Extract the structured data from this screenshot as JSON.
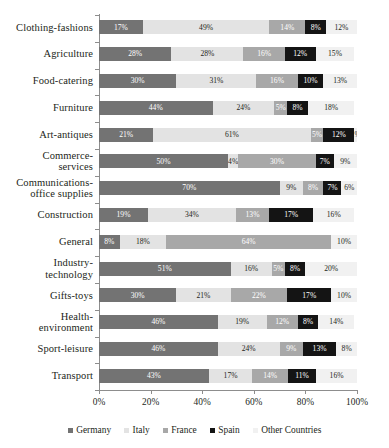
{
  "chart_data": {
    "type": "bar",
    "subtype": "stacked-horizontal-100pct",
    "title": "",
    "xlabel": "",
    "ylabel": "",
    "xlim": [
      0,
      100
    ],
    "xticks": [
      "0%",
      "20%",
      "40%",
      "60%",
      "80%",
      "100%"
    ],
    "xtick_values": [
      0,
      20,
      40,
      60,
      80,
      100
    ],
    "grid": false,
    "legend_position": "bottom",
    "value_suffix": "%",
    "categories": [
      "Clothing-fashions",
      "Agriculture",
      "Food-catering",
      "Furniture",
      "Art-antiques",
      "Commerce-services",
      "Communications-office supplies",
      "Construction",
      "General",
      "Industry-technology",
      "Gifts-toys",
      "Health-environment",
      "Sport-leisure",
      "Transport"
    ],
    "category_lines": [
      [
        "Clothing-fashions"
      ],
      [
        "Agriculture"
      ],
      [
        "Food-catering"
      ],
      [
        "Furniture"
      ],
      [
        "Art-antiques"
      ],
      [
        "Commerce-",
        "services"
      ],
      [
        "Communications-",
        "office supplies"
      ],
      [
        "Construction"
      ],
      [
        "General"
      ],
      [
        "Industry-",
        "technology"
      ],
      [
        "Gifts-toys"
      ],
      [
        "Health-",
        "environment"
      ],
      [
        "Sport-leisure"
      ],
      [
        "Transport"
      ]
    ],
    "series": [
      {
        "name": "Germany",
        "color": "#737373",
        "values": [
          17,
          28,
          30,
          44,
          21,
          50,
          70,
          19,
          8,
          51,
          30,
          46,
          46,
          43
        ]
      },
      {
        "name": "Italy",
        "color": "#e3e3e3",
        "values": [
          49,
          28,
          31,
          24,
          61,
          4,
          9,
          34,
          18,
          16,
          21,
          19,
          24,
          17
        ]
      },
      {
        "name": "France",
        "color": "#a8a8a8",
        "values": [
          14,
          16,
          16,
          5,
          5,
          30,
          8,
          13,
          64,
          5,
          22,
          12,
          9,
          14
        ]
      },
      {
        "name": "Spain",
        "color": "#141414",
        "values": [
          8,
          12,
          10,
          8,
          12,
          7,
          7,
          17,
          0,
          8,
          17,
          8,
          13,
          11
        ]
      },
      {
        "name": "Other Countries",
        "color": "#f1f1f1",
        "values": [
          12,
          15,
          13,
          18,
          1,
          9,
          6,
          16,
          10,
          20,
          10,
          14,
          8,
          16
        ]
      }
    ],
    "labels": {
      "Clothing-fashions": [
        "17%",
        "49%",
        "14%",
        "8%",
        "12%"
      ],
      "Agriculture": [
        "28%",
        "28%",
        "16%",
        "12%",
        "15%"
      ],
      "Food-catering": [
        "30%",
        "31%",
        "16%",
        "10%",
        "13%"
      ],
      "Furniture": [
        "44%",
        "24%",
        "5%",
        "8%",
        "18%"
      ],
      "Art-antiques": [
        "21%",
        "61%",
        "5%",
        "12%",
        "1%"
      ],
      "Commerce-services": [
        "50%",
        "4%",
        "30%",
        "7%",
        "9%"
      ],
      "Communications-office supplies": [
        "70%",
        "9%",
        "8%",
        "7%",
        "6%"
      ],
      "Construction": [
        "19%",
        "34%",
        "13%",
        "17%",
        "16%"
      ],
      "General": [
        "8%",
        "18%",
        "64%",
        "",
        "10%"
      ],
      "Industry-technology": [
        "51%",
        "16%",
        "5%",
        "8%",
        "20%"
      ],
      "Gifts-toys": [
        "30%",
        "21%",
        "22%",
        "17%",
        "10%"
      ],
      "Health-environment": [
        "46%",
        "19%",
        "12%",
        "8%",
        "14%"
      ],
      "Sport-leisure": [
        "46%",
        "24%",
        "9%",
        "13%",
        "8%"
      ],
      "Transport": [
        "43%",
        "17%",
        "14%",
        "11%",
        "16%"
      ]
    }
  },
  "legend": {
    "items": [
      {
        "label": "Germany",
        "color": "#737373"
      },
      {
        "label": "Italy",
        "color": "#e3e3e3"
      },
      {
        "label": "France",
        "color": "#a8a8a8"
      },
      {
        "label": "Spain",
        "color": "#141414"
      },
      {
        "label": "Other Countries",
        "color": "#f1f1f1"
      }
    ]
  }
}
